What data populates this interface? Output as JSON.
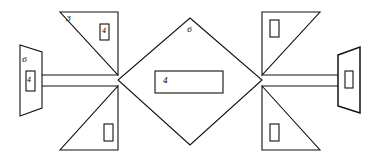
{
  "diagram": {
    "colors": {
      "stroke": "#111111",
      "background": "#ffffff"
    },
    "labels": {
      "top_left_triangle_number": "3",
      "top_left_triangle_inner_box": "4",
      "central_diamond_top": "6",
      "central_rectangle": "4",
      "left_pavilion_top": "6",
      "left_pavilion_inner_box": "4"
    },
    "shapes": {
      "central_diamond": "diamond",
      "central_rectangle": "rectangle",
      "left_pavilion": "trapezoid",
      "right_pavilion": "trapezoid",
      "corridors": [
        "left-corridor",
        "right-corridor"
      ],
      "wings": [
        "top-left-triangle",
        "bottom-left-triangle",
        "top-right-triangle",
        "bottom-right-triangle"
      ]
    }
  }
}
